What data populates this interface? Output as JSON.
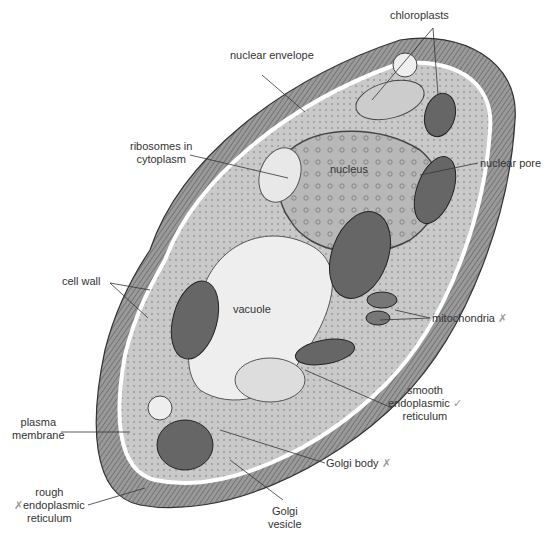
{
  "diagram": {
    "labels": {
      "chloroplasts": "chloroplasts",
      "nuclear_envelope": "nuclear envelope",
      "ribosomes": [
        "ribosomes in",
        "cytoplasm"
      ],
      "nucleus": "nucleus",
      "nuclear_pore": "nuclear pore",
      "cell_wall": "cell wall",
      "vacuole": "vacuole",
      "mitochondria": "mitochondria",
      "smooth_er": [
        "smooth",
        "endoplasmic",
        "reticulum"
      ],
      "plasma_membrane": [
        "plasma",
        "membrane"
      ],
      "golgi_body": "Golgi body",
      "golgi_vesicle": [
        "Golgi",
        "vesicle"
      ],
      "rough_er": [
        "rough",
        "endoplasmic",
        "reticulum"
      ]
    },
    "annotation_marks": {
      "mitochondria": "✗",
      "smooth_er": "✓",
      "golgi_body": "✗",
      "rough_er": "✗"
    },
    "colors": {
      "line": "#333333",
      "cell_fill": "#cfcfcf",
      "wall_fill": "#8a8a8a",
      "vacuole": "#eeeeee",
      "text": "#333333"
    }
  }
}
